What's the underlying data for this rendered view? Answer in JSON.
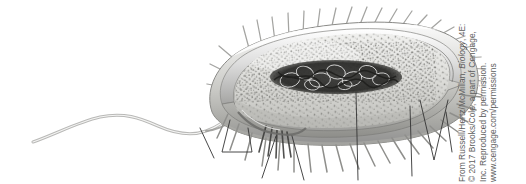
{
  "figure": {
    "alt_description": "Grayscale cutaway illustration of a rod-shaped bacterial (prokaryotic) cell with a single polar flagellum, numerous pili/fimbriae, a dark tangled nucleoid of DNA, and ribosome-speckled cytoplasm. Thin unlabeled leader lines extend below the cell.",
    "background_color": "#ffffff",
    "ink_color": "#6e6e6e",
    "dark_ink_color": "#2b2b2b"
  },
  "credit": {
    "lines": [
      "From Russell/Hertz/McMillan, Biology, 4E:",
      "© 2017 Brooks/Cole, a part of Cengage,",
      "Inc. Reproduced by permission.",
      "www.cengage.com/permissions"
    ],
    "line1_prefix": "From Russell/Hertz/McMillan, ",
    "line1_title": "Biology",
    "line1_suffix": ", 4E:",
    "line2": "© 2017 Brooks/Cole, a part of Cengage,",
    "line3": "Inc. Reproduced by permission.",
    "line4": "www.cengage.com/permissions",
    "orientation": "rotated-90-ccw",
    "text_color": "#5d5d5d"
  },
  "cell_structures": {
    "flagellum": "single polar wavy flagellum extending to the left",
    "pili": "numerous short fimbriae radiating from the cell surface",
    "nucleoid": "dark tangled loop of DNA in the center of the cell",
    "cytoplasm": "pale speckled interior containing ribosomes",
    "envelope": "layered cell wall and plasma membrane shown in cutaway",
    "leader_lines": "six thin unlabeled pointer lines extending below the cell"
  }
}
